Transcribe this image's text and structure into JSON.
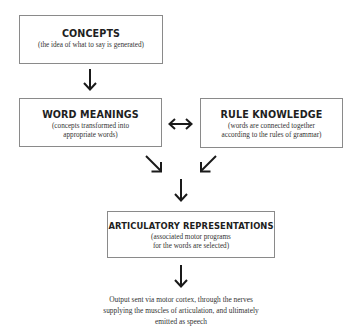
{
  "diagram": {
    "nodes": [
      {
        "id": "concepts",
        "title": "CONCEPTS",
        "subtitle_lines": [
          "(the idea of what to say is generated)"
        ]
      },
      {
        "id": "word_meanings",
        "title": "WORD MEANINGS",
        "subtitle_lines": [
          "(concepts transformed into",
          "appropriate words)"
        ]
      },
      {
        "id": "rule_knowledge",
        "title": "RULE KNOWLEDGE",
        "subtitle_lines": [
          "(words are connected together",
          "according to the rules of grammar)"
        ]
      },
      {
        "id": "articulatory_representations",
        "title": "ARTICULATORY REPRESENTATIONS",
        "subtitle_lines": [
          "(associated motor programs",
          "for the words are selected)"
        ]
      }
    ],
    "output": {
      "lines": [
        "Output sent via motor cortex, through the nerves",
        "supplying the muscles of articulation, and ultimately",
        "emitted as speech"
      ]
    },
    "edges": [
      {
        "from": "concepts",
        "to": "word_meanings",
        "type": "down-arrow"
      },
      {
        "from": "word_meanings",
        "to": "rule_knowledge",
        "type": "bidirectional-arrow"
      },
      {
        "from": "word_meanings",
        "to": "articulatory_representations",
        "type": "diagonal-arrow"
      },
      {
        "from": "rule_knowledge",
        "to": "articulatory_representations",
        "type": "diagonal-arrow"
      },
      {
        "from": "articulatory_representations",
        "to": "output",
        "type": "down-arrow"
      }
    ]
  }
}
